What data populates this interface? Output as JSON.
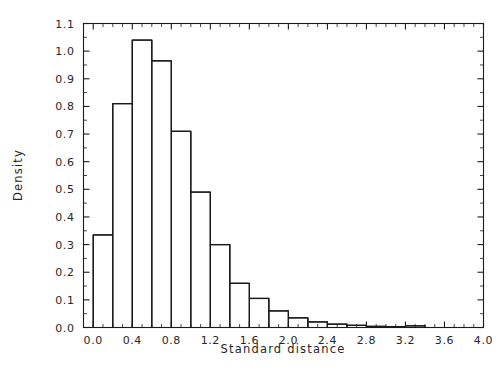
{
  "chart_data": {
    "type": "bar",
    "title": "",
    "subtitle": "",
    "xlabel": "Standard distance",
    "ylabel": "Density",
    "xlim": [
      -0.1,
      4.0
    ],
    "ylim": [
      0.0,
      1.1
    ],
    "grid": false,
    "legend": null,
    "bin_width": 0.2,
    "bar_style": "outline-only",
    "xticks": [
      "0.0",
      "0.4",
      "0.8",
      "1.2",
      "1.6",
      "2.0",
      "2.4",
      "2.8",
      "3.2",
      "3.6",
      "4.0"
    ],
    "xtick_values": [
      0.0,
      0.4,
      0.8,
      1.2,
      1.6,
      2.0,
      2.4,
      2.8,
      3.2,
      3.6,
      4.0
    ],
    "xtick_minor_step": 0.1,
    "yticks": [
      "0.0",
      "0.1",
      "0.2",
      "0.3",
      "0.4",
      "0.5",
      "0.6",
      "0.7",
      "0.8",
      "0.9",
      "1.0",
      "1.1"
    ],
    "ytick_values": [
      0.0,
      0.1,
      0.2,
      0.3,
      0.4,
      0.5,
      0.6,
      0.7,
      0.8,
      0.9,
      1.0,
      1.1
    ],
    "ytick_minor_step": 0.05,
    "bin_edges": [
      0.0,
      0.2,
      0.4,
      0.6,
      0.8,
      1.0,
      1.2,
      1.4,
      1.6,
      1.8,
      2.0,
      2.2,
      2.4,
      2.6,
      2.8,
      3.0,
      3.2,
      3.4
    ],
    "categories": [
      "0.0-0.2",
      "0.2-0.4",
      "0.4-0.6",
      "0.6-0.8",
      "0.8-1.0",
      "1.0-1.2",
      "1.2-1.4",
      "1.4-1.6",
      "1.6-1.8",
      "1.8-2.0",
      "2.0-2.2",
      "2.2-2.4",
      "2.4-2.6",
      "2.6-2.8",
      "2.8-3.0",
      "3.0-3.2",
      "3.2-3.4"
    ],
    "values": [
      0.335,
      0.81,
      1.04,
      0.965,
      0.71,
      0.49,
      0.3,
      0.16,
      0.105,
      0.06,
      0.035,
      0.02,
      0.012,
      0.008,
      0.004,
      0.003,
      0.006
    ]
  },
  "colors": {
    "background": "#ffffff",
    "line": "#1a1a1a",
    "text": "#262626"
  }
}
